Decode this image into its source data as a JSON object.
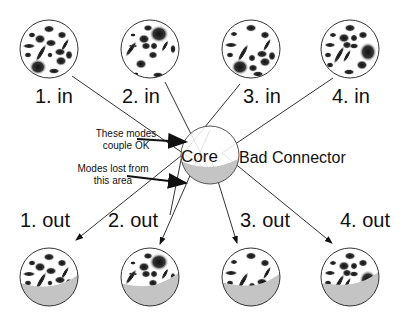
{
  "diagram": {
    "core_label": "Core",
    "connector_label": "Bad Connector",
    "annotations": [
      {
        "line1": "These modes",
        "line2": "couple OK"
      },
      {
        "line1": "Modes lost from",
        "line2": "this area"
      }
    ],
    "inputs": [
      {
        "label": "1. in"
      },
      {
        "label": "2. in"
      },
      {
        "label": "3. in"
      },
      {
        "label": "4. in"
      }
    ],
    "outputs": [
      {
        "label": "1. out"
      },
      {
        "label": "2. out"
      },
      {
        "label": "3. out"
      },
      {
        "label": "4. out"
      }
    ],
    "colors": {
      "lost_area": "#c4c4c4",
      "outline": "#333333",
      "mode_blob": "#1a1a1a"
    }
  }
}
